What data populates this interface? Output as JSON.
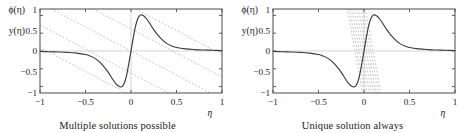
{
  "figure": {
    "width": 470,
    "height": 133,
    "background": "#ffffff",
    "curve_color": "#3a3a3a",
    "dotted_color": "#b9b9b9",
    "frame_color": "#4a4a4a",
    "zero_axis_color": "#c8c8c8"
  },
  "panels": [
    {
      "id": "left",
      "caption": "Multiple solutions possible",
      "y_axis_labels": [
        "ϕ(η)",
        "y(η)"
      ],
      "y_ticks": [
        "1",
        "0.5",
        "0",
        "−0.5",
        "−1"
      ],
      "y_tick_values": [
        1,
        0.5,
        0,
        -0.5,
        -1
      ],
      "x_ticks": [
        "−1",
        "−0.5",
        "0",
        "0.5",
        "1"
      ],
      "x_tick_values": [
        -1,
        -0.5,
        0,
        0.5,
        1
      ],
      "x_axis_name": "η",
      "line_style": "shallow-negative-slope",
      "line_slope": -1.35,
      "line_intercepts": [
        -1.25,
        -0.62,
        0.0,
        0.62,
        1.25
      ],
      "line_count": 5
    },
    {
      "id": "right",
      "caption": "Unique solution always",
      "y_axis_labels": [
        "ϕ(η)",
        "y(η)"
      ],
      "y_ticks": [
        "1",
        "0.5",
        "0",
        "−0.5",
        "−1"
      ],
      "y_tick_values": [
        1,
        0.5,
        0,
        -0.5,
        -1
      ],
      "x_ticks": [
        "−1",
        "−0.5",
        "0",
        "0.5",
        "1"
      ],
      "x_tick_values": [
        -1,
        -0.5,
        0,
        0.5,
        1
      ],
      "x_axis_name": "η",
      "line_style": "steep-negative-slope",
      "line_slope": -14.0,
      "line_intercepts": [
        -1.4,
        -1.05,
        -0.7,
        -0.35,
        0.0,
        0.35,
        0.7,
        1.05,
        1.4
      ],
      "line_count": 9
    }
  ],
  "chart_data": {
    "type": "line",
    "title": "",
    "xlabel": "η",
    "ylabel": "ϕ(η), y(η)",
    "xlim": [
      -1,
      1
    ],
    "ylim": [
      -1.18,
      1.18
    ],
    "xticks": [
      -1,
      -0.5,
      0,
      0.5,
      1
    ],
    "xticklabels": [
      "−1",
      "−0.5",
      "0",
      "0.5",
      "1"
    ],
    "yticks": [
      1,
      0.5,
      0,
      -0.5,
      -1
    ],
    "yticklabels": [
      "1",
      "0.5",
      "0",
      "−0.5",
      "−1"
    ],
    "grid": false,
    "legend": "none",
    "series": [
      {
        "name": "ϕ(η)",
        "panel": "both",
        "style": "solid",
        "color": "#3a3a3a",
        "description": "odd sigmoid-derivative shaped curve, minimum -1.0 near η=-0.11, maximum +1.03 near η=+0.11, asymptotic to 0 at both ends",
        "x": [
          -1.0,
          -0.9,
          -0.8,
          -0.7,
          -0.6,
          -0.5,
          -0.45,
          -0.4,
          -0.35,
          -0.3,
          -0.25,
          -0.2,
          -0.16,
          -0.13,
          -0.11,
          -0.09,
          -0.07,
          -0.05,
          -0.03,
          -0.015,
          0.0,
          0.015,
          0.03,
          0.05,
          0.07,
          0.09,
          0.11,
          0.13,
          0.16,
          0.2,
          0.25,
          0.3,
          0.35,
          0.4,
          0.45,
          0.5,
          0.6,
          0.7,
          0.8,
          0.9,
          1.0
        ],
        "y": [
          -0.015,
          -0.02,
          -0.028,
          -0.04,
          -0.06,
          -0.1,
          -0.14,
          -0.2,
          -0.3,
          -0.43,
          -0.6,
          -0.8,
          -0.94,
          -1.0,
          -1.01,
          -0.98,
          -0.88,
          -0.7,
          -0.44,
          -0.22,
          0.0,
          0.22,
          0.44,
          0.7,
          0.88,
          0.98,
          1.02,
          1.0,
          0.94,
          0.8,
          0.6,
          0.43,
          0.3,
          0.2,
          0.14,
          0.1,
          0.06,
          0.04,
          0.028,
          0.02,
          0.015
        ]
      },
      {
        "name": "y(η) family (left panel)",
        "panel": "left",
        "style": "dotted",
        "color": "#b9b9b9",
        "slope": -1.35,
        "intercepts": [
          -1.25,
          -0.62,
          0.0,
          0.62,
          1.25
        ]
      },
      {
        "name": "y(η) family (right panel)",
        "panel": "right",
        "style": "dotted",
        "color": "#b9b9b9",
        "slope": -14.0,
        "intercepts": [
          -1.4,
          -1.05,
          -0.7,
          -0.35,
          0.0,
          0.35,
          0.7,
          1.05,
          1.4
        ]
      }
    ]
  }
}
